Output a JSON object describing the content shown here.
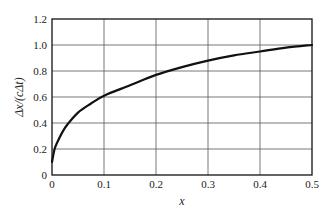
{
  "chart_data": {
    "type": "line",
    "title": "",
    "xlabel": "x",
    "ylabel": "Δx/(cΔt)",
    "xlim": [
      0,
      0.5
    ],
    "ylim": [
      0,
      1.2
    ],
    "grid": true,
    "legend": null,
    "x_ticks": [
      "0",
      "0.1",
      "0.2",
      "0.3",
      "0.4",
      "0.5"
    ],
    "y_ticks": [
      "0",
      "0.2",
      "0.4",
      "0.6",
      "0.8",
      "1.0",
      "1.2"
    ],
    "series": [
      {
        "name": "curve",
        "color": "#111111",
        "x": [
          0,
          0.005,
          0.01,
          0.02,
          0.03,
          0.05,
          0.075,
          0.1,
          0.15,
          0.2,
          0.25,
          0.3,
          0.35,
          0.4,
          0.45,
          0.5
        ],
        "y": [
          0.1,
          0.2,
          0.25,
          0.33,
          0.39,
          0.48,
          0.55,
          0.61,
          0.69,
          0.77,
          0.83,
          0.88,
          0.92,
          0.95,
          0.98,
          1.0
        ]
      }
    ]
  }
}
